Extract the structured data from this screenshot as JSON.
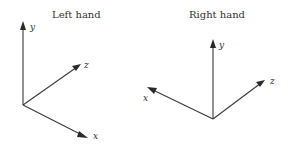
{
  "diagrams": [
    {
      "title": "Left hand",
      "axes": {
        "y": "y",
        "z": "z",
        "x": "x"
      },
      "origin": [
        23,
        105
      ],
      "tips": {
        "y": [
          23,
          22
        ],
        "z": [
          81,
          64
        ],
        "x": [
          87,
          138
        ]
      }
    },
    {
      "title": "Right hand",
      "axes": {
        "y": "y",
        "z": "z",
        "x": "x"
      },
      "origin": [
        213,
        119
      ],
      "tips": {
        "y": [
          213,
          40
        ],
        "z": [
          265,
          80
        ],
        "x": [
          148,
          87
        ]
      }
    }
  ],
  "colors": {
    "line": "#3a3a3a",
    "text": "#333333",
    "background": "#ffffff"
  }
}
